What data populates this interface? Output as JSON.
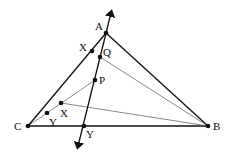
{
  "diagram": {
    "type": "geometry",
    "points": {
      "A": {
        "label": "A",
        "x": 106,
        "y": 33,
        "lx": 95,
        "ly": 30
      },
      "B": {
        "label": "B",
        "x": 208,
        "y": 126,
        "lx": 213,
        "ly": 130
      },
      "C": {
        "label": "C",
        "x": 28,
        "y": 126,
        "lx": 14,
        "ly": 130
      },
      "P": {
        "label": "P",
        "x": 95,
        "y": 80,
        "lx": 99,
        "ly": 84
      },
      "Q": {
        "label": "Q",
        "x": 100,
        "y": 57,
        "lx": 103,
        "ly": 56
      },
      "X1": {
        "label": "X",
        "x": 92,
        "y": 51,
        "lx": 79,
        "ly": 51
      },
      "X2": {
        "label": "X",
        "x": 61,
        "y": 103,
        "lx": 60,
        "ly": 117
      },
      "Y1": {
        "label": "Y",
        "x": 47,
        "y": 113,
        "lx": 49,
        "ly": 126
      },
      "Y2": {
        "label": "Y",
        "x": 84,
        "y": 126,
        "lx": 86,
        "ly": 138
      }
    },
    "line_arrow": {
      "x1": 78,
      "y1": 146,
      "x2": 111,
      "y2": 13
    }
  }
}
